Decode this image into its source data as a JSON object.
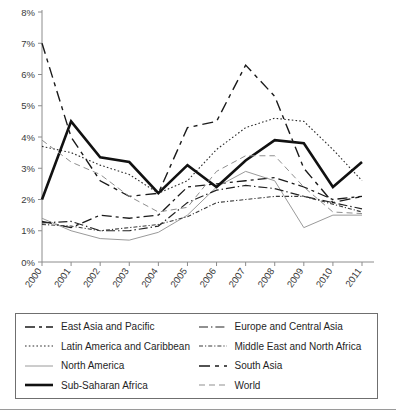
{
  "chart_data": {
    "type": "line",
    "title": "",
    "xlabel": "",
    "ylabel": "",
    "ylim": [
      0,
      8
    ],
    "yticks": [
      "0%",
      "1%",
      "2%",
      "3%",
      "4%",
      "5%",
      "6%",
      "7%",
      "8%"
    ],
    "ytick_values": [
      0,
      1,
      2,
      3,
      4,
      5,
      6,
      7,
      8
    ],
    "grid": false,
    "legend_position": "below-plot",
    "x": [
      "2000",
      "2001",
      "2002",
      "2003",
      "2004",
      "2005",
      "2006",
      "2007",
      "2008",
      "2009",
      "2010",
      "2011"
    ],
    "categories": [
      "2000",
      "2001",
      "2002",
      "2003",
      "2004",
      "2005",
      "2006",
      "2007",
      "2008",
      "2009",
      "2010",
      "2011"
    ],
    "series": [
      {
        "name": "East Asia and Pacific",
        "dash": "10,4,3,4",
        "width": 1.3,
        "color": "#1a1a1a",
        "values": [
          1.3,
          1.1,
          1.5,
          1.4,
          1.5,
          2.4,
          2.5,
          2.6,
          2.7,
          2.4,
          2.0,
          2.1
        ]
      },
      {
        "name": "Latin America and Caribbean",
        "dash": "1.6,2.2",
        "width": 1.1,
        "color": "#2b2b2b",
        "values": [
          3.7,
          3.5,
          3.1,
          2.8,
          2.2,
          2.6,
          3.6,
          4.3,
          4.6,
          4.5,
          3.6,
          2.6
        ]
      },
      {
        "name": "North America",
        "dash": "",
        "width": 1.0,
        "color": "#9a9a9a",
        "values": [
          1.4,
          1.0,
          0.75,
          0.7,
          0.95,
          1.5,
          2.4,
          2.9,
          2.6,
          1.1,
          1.5,
          1.5
        ]
      },
      {
        "name": "Sub-Saharan Africa",
        "dash": "",
        "width": 2.6,
        "color": "#111111",
        "values": [
          2.0,
          4.5,
          3.35,
          3.2,
          2.2,
          3.1,
          2.4,
          3.25,
          3.9,
          3.8,
          2.4,
          3.2
        ]
      },
      {
        "name": "Europe and Central Asia",
        "dash": "9,3,1.4,3",
        "width": 1.2,
        "color": "#222222",
        "values": [
          1.25,
          1.3,
          1.0,
          1.0,
          1.15,
          1.9,
          2.3,
          2.45,
          2.35,
          2.1,
          1.9,
          1.7
        ]
      },
      {
        "name": "Middle East and North Africa",
        "dash": "4,2,1.2,2",
        "width": 1.1,
        "color": "#3a3a3a",
        "values": [
          1.2,
          1.15,
          1.0,
          1.1,
          1.2,
          1.45,
          1.9,
          2.0,
          2.1,
          2.1,
          1.85,
          1.6
        ]
      },
      {
        "name": "South Asia",
        "dash": "11,5,4,5",
        "width": 1.4,
        "color": "#1a1a1a",
        "values": [
          7.0,
          4.0,
          2.6,
          2.1,
          2.2,
          4.3,
          4.5,
          6.3,
          5.3,
          3.0,
          1.9,
          2.1
        ]
      },
      {
        "name": "World",
        "dash": "6,4",
        "width": 1.0,
        "color": "#8f8f8f",
        "values": [
          3.9,
          3.2,
          2.8,
          2.1,
          1.6,
          1.75,
          2.9,
          3.4,
          3.4,
          2.4,
          1.6,
          1.55
        ]
      }
    ]
  },
  "legend": {
    "items": [
      {
        "label": "East Asia and Pacific",
        "series_index": 0
      },
      {
        "label": "Europe and Central Asia",
        "series_index": 4
      },
      {
        "label": "Latin America and Caribbean",
        "series_index": 1
      },
      {
        "label": "Middle East and North Africa",
        "series_index": 5
      },
      {
        "label": "North America",
        "series_index": 2
      },
      {
        "label": "South Asia",
        "series_index": 6
      },
      {
        "label": "Sub-Saharan Africa",
        "series_index": 3
      },
      {
        "label": "World",
        "series_index": 7
      }
    ]
  },
  "colors": {
    "axis": "#8c8c8c",
    "text": "#2b2b2b",
    "legend_border": "#6f6f6f"
  }
}
